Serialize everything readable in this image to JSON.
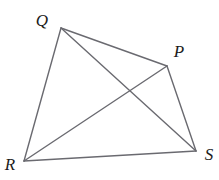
{
  "figure": {
    "name": "quadrilateral-with-diagonals",
    "background_color": "#ffffff",
    "line_color": "#6a6a70",
    "line_width": 1.4,
    "label_color": "#1b1b1b",
    "canvas": {
      "width": 219,
      "height": 180
    },
    "vertices": [
      {
        "id": "Q",
        "label": "Q",
        "x": 61,
        "y": 28,
        "label_x": 42,
        "label_y": 20
      },
      {
        "id": "P",
        "label": "P",
        "x": 167,
        "y": 66,
        "label_x": 179,
        "label_y": 51
      },
      {
        "id": "S",
        "label": "S",
        "x": 196,
        "y": 151,
        "label_x": 209,
        "label_y": 154
      },
      {
        "id": "R",
        "label": "R",
        "x": 24,
        "y": 161,
        "label_x": 10,
        "label_y": 164
      }
    ],
    "edges": [
      {
        "name": "edge-QP",
        "from": "Q",
        "to": "P",
        "x1": 61,
        "y1": 28,
        "x2": 167,
        "y2": 66
      },
      {
        "name": "edge-PS",
        "from": "P",
        "to": "S",
        "x1": 167,
        "y1": 66,
        "x2": 196,
        "y2": 151
      },
      {
        "name": "edge-SR",
        "from": "S",
        "to": "R",
        "x1": 196,
        "y1": 151,
        "x2": 24,
        "y2": 161
      },
      {
        "name": "edge-RQ",
        "from": "R",
        "to": "Q",
        "x1": 24,
        "y1": 161,
        "x2": 61,
        "y2": 28
      }
    ],
    "diagonals": [
      {
        "name": "diagonal-QS",
        "from": "Q",
        "to": "S",
        "x1": 61,
        "y1": 28,
        "x2": 196,
        "y2": 151
      },
      {
        "name": "diagonal-RP",
        "from": "R",
        "to": "P",
        "x1": 24,
        "y1": 161,
        "x2": 167,
        "y2": 66
      }
    ],
    "intersection": {
      "name": "diagonal-intersection",
      "x": 127,
      "y": 94
    }
  }
}
